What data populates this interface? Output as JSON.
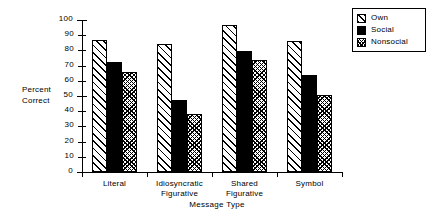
{
  "chart_data": {
    "type": "bar",
    "title": "",
    "xlabel": "Message Type",
    "ylabel": "Percent Correct",
    "ylabel_lines": [
      "Percent",
      "Correct"
    ],
    "categories": [
      "Literal",
      "Idiosyncratic Figurative",
      "Shared Figurative",
      "Symbol"
    ],
    "category_lines": [
      [
        "Literal"
      ],
      [
        "Idiosyncratic",
        "Figurative"
      ],
      [
        "Shared",
        "Figurative"
      ],
      [
        "Symbol"
      ]
    ],
    "series": [
      {
        "name": "Own",
        "values": [
          87,
          84,
          96.5,
          86.5
        ],
        "pattern": "diagonal-hatch",
        "color": "#000000"
      },
      {
        "name": "Social",
        "values": [
          72.5,
          47.5,
          79.5,
          64
        ],
        "pattern": "solid-black",
        "color": "#000000"
      },
      {
        "name": "Nonsocial",
        "values": [
          66,
          38,
          73.5,
          50.5
        ],
        "pattern": "cross-hatch",
        "color": "#000000"
      }
    ],
    "ylim": [
      0,
      100
    ],
    "yticks": [
      0,
      10,
      20,
      30,
      40,
      50,
      60,
      70,
      80,
      90,
      100
    ],
    "ytick_labels": [
      "0",
      "10",
      "20",
      "30",
      "40",
      "50",
      "60",
      "70",
      "80",
      "90",
      "100"
    ],
    "grid": false,
    "legend_position": "top-right",
    "legend_entries": [
      "Own",
      "Social",
      "Nonsocial"
    ]
  }
}
